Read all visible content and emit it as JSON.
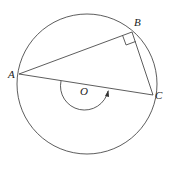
{
  "diagram": {
    "type": "circle-geometry",
    "circle": {
      "center_label": "O",
      "cx": 87,
      "cy": 84,
      "r": 70
    },
    "points": [
      {
        "label": "A",
        "x": 19,
        "y": 74
      },
      {
        "label": "B",
        "x": 132,
        "y": 32
      },
      {
        "label": "C",
        "x": 153,
        "y": 95
      }
    ],
    "segments": [
      "AB",
      "BC",
      "AC"
    ],
    "right_angle_at": "B",
    "arc_marker": {
      "around": "O",
      "direction": "clockwise-arrow"
    },
    "colors": {
      "stroke": "#333333",
      "background": "#ffffff"
    }
  },
  "labels": {
    "A": "A",
    "B": "B",
    "C": "C",
    "O": "O"
  }
}
